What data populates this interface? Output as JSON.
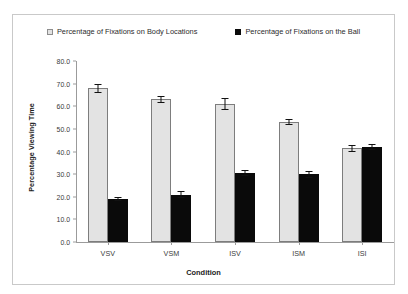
{
  "chart_data": {
    "type": "bar",
    "title": "",
    "xlabel": "Condition",
    "ylabel": "Percentage Viewing Time",
    "categories": [
      "VSV",
      "VSM",
      "ISV",
      "ISM",
      "ISI"
    ],
    "ylim": [
      0.0,
      80.0
    ],
    "ytick_labels": [
      "80.0",
      "70.0",
      "60.0",
      "50.0",
      "40.0",
      "30.0",
      "20.0",
      "10.0",
      "0.0"
    ],
    "ytick_values": [
      80.0,
      70.0,
      60.0,
      50.0,
      40.0,
      30.0,
      20.0,
      10.0,
      0.0
    ],
    "grid": false,
    "legend_position": "top-center",
    "series": [
      {
        "name": "Percentage of Fixations on Body Locations",
        "marker": "open-square",
        "color": "#e3e3e3",
        "values": [
          68.0,
          63.0,
          61.0,
          53.0,
          41.5
        ],
        "errors": [
          2.0,
          1.5,
          2.5,
          1.5,
          1.5
        ]
      },
      {
        "name": "Percentage of Fixations on the Ball",
        "marker": "filled-square",
        "color": "#0a0a0a",
        "values": [
          19.0,
          21.0,
          30.5,
          30.0,
          42.0
        ],
        "errors": [
          1.0,
          1.5,
          1.5,
          1.5,
          1.5
        ]
      }
    ]
  },
  "legend": {
    "entries": [
      "Percentage of Fixations on Body Locations",
      "Percentage of Fixations on the Ball"
    ]
  }
}
